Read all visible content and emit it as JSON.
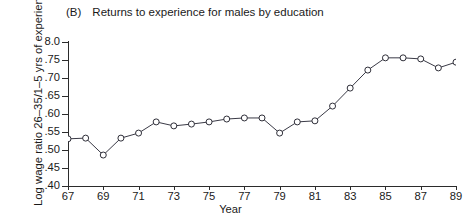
{
  "figure": {
    "panel_letter": "(B)",
    "title": "Returns to experience for males by education"
  },
  "axes": {
    "ylabel": "Log wage ratio 26–35/1–5 yrs of experience",
    "xlabel": "Year",
    "ytick_labels": [
      "8.0",
      ".75",
      ".70",
      ".65",
      ".60",
      ".55",
      ".50",
      ".45",
      ".40"
    ],
    "xtick_labels": [
      "67",
      "69",
      "71",
      "73",
      "75",
      "77",
      "79",
      "81",
      "83",
      "85",
      "87",
      "89"
    ]
  },
  "chart_data": {
    "type": "line",
    "title": "(B) Returns to experience for males by education",
    "xlabel": "Year",
    "ylabel": "Log wage ratio 26-35/1-5 yrs of experience",
    "xlim": [
      67,
      89
    ],
    "ylim": [
      0.4,
      0.8
    ],
    "yticks": [
      0.4,
      0.45,
      0.5,
      0.55,
      0.6,
      0.65,
      0.7,
      0.75,
      0.8
    ],
    "ytick_labels": [
      "40",
      "45",
      "50",
      "55",
      "60",
      "65",
      "70",
      "75",
      "8.0"
    ],
    "xticks": [
      67,
      69,
      71,
      73,
      75,
      77,
      79,
      81,
      83,
      85,
      87,
      89
    ],
    "grid": false,
    "legend": "none",
    "marker": "open-circle",
    "x": [
      67,
      68,
      69,
      70,
      71,
      72,
      73,
      74,
      75,
      76,
      77,
      78,
      79,
      80,
      81,
      82,
      83,
      84,
      85,
      86,
      87,
      88,
      89
    ],
    "y": [
      0.531,
      0.533,
      0.486,
      0.533,
      0.547,
      0.578,
      0.567,
      0.572,
      0.578,
      0.586,
      0.589,
      0.589,
      0.547,
      0.578,
      0.581,
      0.622,
      0.672,
      0.722,
      0.756,
      0.756,
      0.753,
      0.728,
      0.744
    ]
  }
}
